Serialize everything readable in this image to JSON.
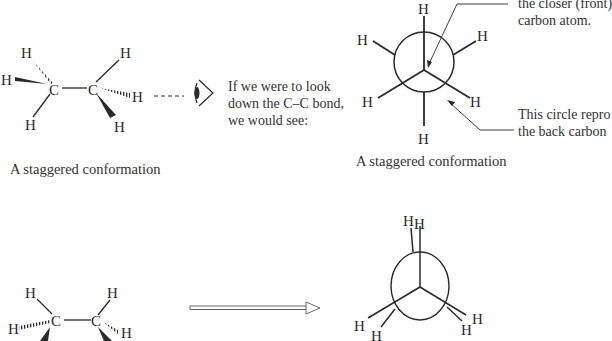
{
  "top_left": {
    "caption": "A staggered conformation",
    "atoms": {
      "c1": "C",
      "c2": "C",
      "h": "H"
    }
  },
  "viewer_note": {
    "line1": "If we were to look",
    "line2": "down the C–C bond,",
    "line3": "we would see:"
  },
  "top_right": {
    "caption": "A staggered conformation",
    "front_note": {
      "line1": "the closer (front)",
      "line2": "carbon atom."
    },
    "back_note": {
      "line1": "This circle repro",
      "line2": "the back carbon"
    }
  },
  "bottom_left": {
    "atoms": {
      "c1": "C",
      "c2": "C",
      "h": "H"
    }
  },
  "bottom_right": {
    "h": "H"
  },
  "colors": {
    "ink": "#2a2a2a"
  }
}
